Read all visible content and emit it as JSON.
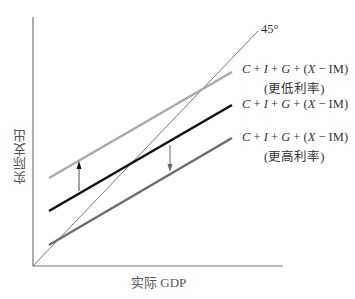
{
  "diagram": {
    "type": "aggregate-demand-45-degree",
    "axes": {
      "x_label": "实际 GDP",
      "y_label": "实际支出"
    },
    "reference_line": {
      "label": "45°",
      "color": "#555555"
    },
    "lines": [
      {
        "id": "lower-rate",
        "equation": "C + I + G + (X − IM)",
        "note": "(更低利率)",
        "color": "#aaaaaa",
        "from": [
          49,
          178
        ],
        "to": [
          232,
          72
        ]
      },
      {
        "id": "original",
        "equation": "C + I + G + (X − IM)",
        "note": "",
        "color": "#111111",
        "from": [
          49,
          211
        ],
        "to": [
          232,
          105
        ]
      },
      {
        "id": "higher-rate",
        "equation": "C + I + G + (X − IM)",
        "note": "(更高利率)",
        "color": "#6e6e6e",
        "from": [
          49,
          245
        ],
        "to": [
          232,
          138
        ]
      }
    ],
    "arrows": [
      {
        "direction": "up",
        "meaning": "lower interest rate shifts expenditure up"
      },
      {
        "direction": "down",
        "meaning": "higher interest rate shifts expenditure down"
      }
    ]
  },
  "labels": {
    "deg45": "45°",
    "x_axis": "实际 GDP",
    "y_axis": "实际支出",
    "eq_parts": {
      "c": "C",
      "i": "I",
      "g": "G",
      "x": "X",
      "plus": " + ",
      "open": "(",
      "minus": " − ",
      "im": "IM)"
    },
    "lower_note": "(更低利率)",
    "higher_note": "(更高利率)"
  }
}
